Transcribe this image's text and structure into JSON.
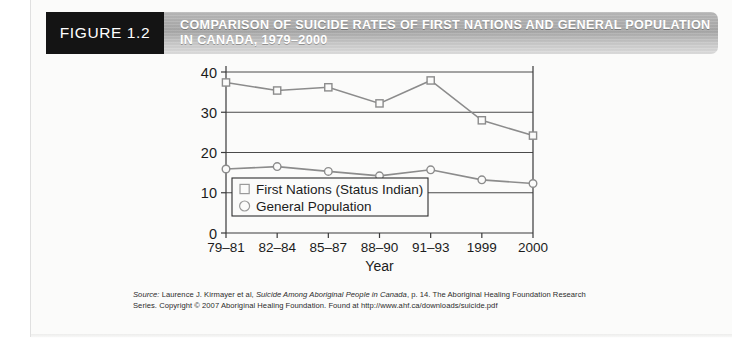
{
  "figure": {
    "number_label": "FIGURE 1.2",
    "title_line1": "COMPARISON OF SUICIDE RATES OF FIRST NATIONS AND GENERAL POPULATION",
    "title_line2": "IN CANADA, 1979–2000",
    "header_bg_color": "#b0b0b0",
    "number_bg_color": "#141414"
  },
  "source": {
    "label": "Source:",
    "text_before_italic": " Laurence J. Kirmayer et al, ",
    "italic_title": "Suicide Among Aboriginal People in Canada",
    "text_after_italic": ", p. 14. The Aboriginal Healing Foundation Research Series. Copyright © 2007 Aboriginal Healing Foundation. Found at  http://www.ahf.ca/downloads/suicide.pdf"
  },
  "chart_data": {
    "type": "line",
    "title": "",
    "xlabel": "Year",
    "ylabel": "",
    "categories": [
      "79–81",
      "82–84",
      "85–87",
      "88–90",
      "91–93",
      "1999",
      "2000"
    ],
    "yticks": [
      "0",
      "10",
      "20",
      "30",
      "40"
    ],
    "ylim": [
      0,
      40
    ],
    "grid": true,
    "legend_position": "bottom-left-inside",
    "series": [
      {
        "name": "First Nations (Status Indian)",
        "marker": "square",
        "color": "#8c8c8c",
        "values": [
          37.4,
          35.4,
          36.2,
          32.2,
          37.9,
          28.0,
          24.2
        ]
      },
      {
        "name": "General Population",
        "marker": "circle",
        "color": "#8c8c8c",
        "values": [
          15.9,
          16.5,
          15.3,
          14.2,
          15.7,
          13.2,
          12.3
        ]
      }
    ]
  }
}
